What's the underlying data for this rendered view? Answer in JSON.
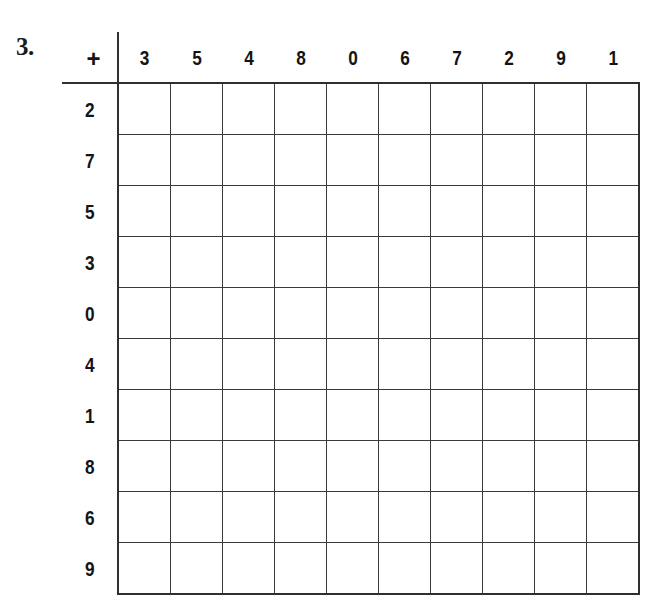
{
  "worksheet": {
    "problem_number": "3.",
    "operator": "+",
    "grid": {
      "type": "addition-table",
      "column_headers": [
        "3",
        "5",
        "4",
        "8",
        "0",
        "6",
        "7",
        "2",
        "9",
        "1"
      ],
      "row_headers": [
        "2",
        "7",
        "5",
        "3",
        "0",
        "4",
        "1",
        "8",
        "6",
        "9"
      ],
      "rows": 10,
      "columns": 10,
      "cells_blank": true,
      "cell_values": [
        [
          "",
          "",
          "",
          "",
          "",
          "",
          "",
          "",
          "",
          ""
        ],
        [
          "",
          "",
          "",
          "",
          "",
          "",
          "",
          "",
          "",
          ""
        ],
        [
          "",
          "",
          "",
          "",
          "",
          "",
          "",
          "",
          "",
          ""
        ],
        [
          "",
          "",
          "",
          "",
          "",
          "",
          "",
          "",
          "",
          ""
        ],
        [
          "",
          "",
          "",
          "",
          "",
          "",
          "",
          "",
          "",
          ""
        ],
        [
          "",
          "",
          "",
          "",
          "",
          "",
          "",
          "",
          "",
          ""
        ],
        [
          "",
          "",
          "",
          "",
          "",
          "",
          "",
          "",
          "",
          ""
        ],
        [
          "",
          "",
          "",
          "",
          "",
          "",
          "",
          "",
          "",
          ""
        ],
        [
          "",
          "",
          "",
          "",
          "",
          "",
          "",
          "",
          "",
          ""
        ],
        [
          "",
          "",
          "",
          "",
          "",
          "",
          "",
          "",
          "",
          ""
        ]
      ]
    },
    "colors": {
      "page_background": "#ffffff",
      "grid_line": "#3a3a3a",
      "grid_line_bold": "#2f2f2f",
      "text": "#141414"
    }
  }
}
